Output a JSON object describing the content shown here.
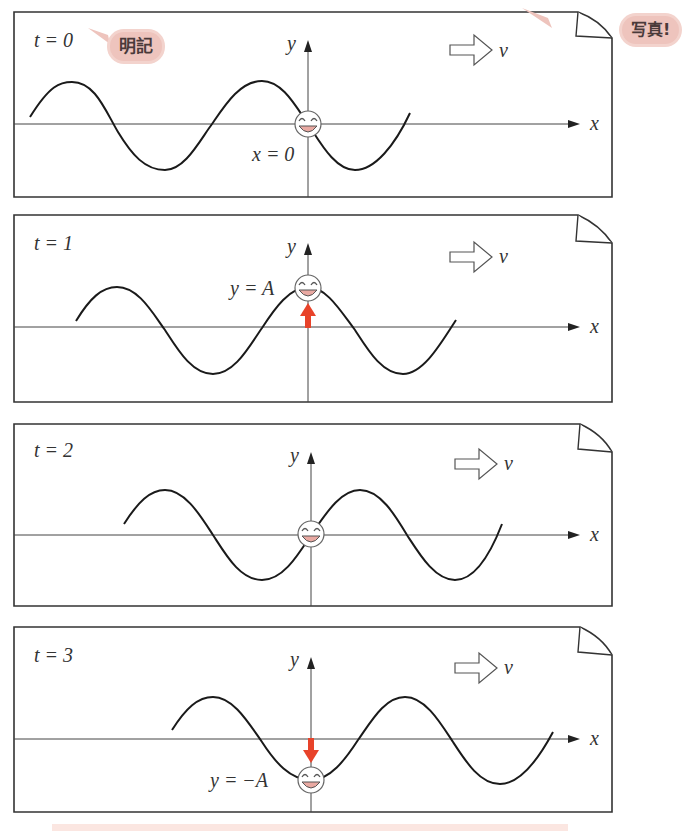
{
  "figure": {
    "annotations": {
      "memorize_bubble": "明記",
      "photo_bubble": "写真!"
    },
    "colors": {
      "curve": "#1a1a1a",
      "axis": "#444444",
      "arrow_red": "#e8432a",
      "bubble_bg": "#eec4bd",
      "face_mouth": "#e9a9a2"
    },
    "panels": [
      {
        "time_label": "t = 0",
        "y_axis": "y",
        "x_axis": "x",
        "velocity_label": "v",
        "point_label": "x = 0",
        "point_state": "at equilibrium (y = 0)",
        "arrow": "none"
      },
      {
        "time_label": "t = 1",
        "y_axis": "y",
        "x_axis": "x",
        "velocity_label": "v",
        "point_label": "y = A",
        "point_state": "at crest (y = A)",
        "arrow": "up"
      },
      {
        "time_label": "t = 2",
        "y_axis": "y",
        "x_axis": "x",
        "velocity_label": "v",
        "point_label": "",
        "point_state": "at equilibrium (y = 0)",
        "arrow": "none"
      },
      {
        "time_label": "t = 3",
        "y_axis": "y",
        "x_axis": "x",
        "velocity_label": "v",
        "point_label": "y = −A",
        "point_state": "at trough (y = −A)",
        "arrow": "down"
      }
    ]
  }
}
